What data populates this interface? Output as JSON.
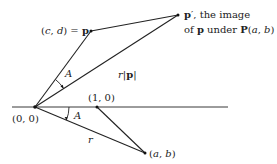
{
  "diagram": {
    "points": {
      "origin": {
        "label": "(0, 0)"
      },
      "unit": {
        "label": "(1, 0)"
      },
      "ab": {
        "label_open": "(",
        "a": "a",
        "sep": ", ",
        "b": "b",
        "label_close": ")"
      },
      "p": {
        "label_open": "(",
        "c": "c",
        "sep": ", ",
        "d": "d",
        "label_mid": ") = ",
        "vec": "p"
      },
      "p_prime": {
        "vec": "p",
        "prime": "′",
        "line1_rest": ", the image",
        "line2_of": "of ",
        "line2_vec": "p",
        "line2_under": " under ",
        "line2_op": "P",
        "line2_open": "(",
        "line2_a": "a",
        "line2_sep": ", ",
        "line2_b": "b",
        "line2_close": ")"
      }
    },
    "segment_labels": {
      "r": "r",
      "r_norm_r": "r",
      "r_norm_bar_open": "|",
      "r_norm_vec": "p",
      "r_norm_bar_close": "|"
    },
    "angles": {
      "upper": "A",
      "lower": "A"
    }
  }
}
